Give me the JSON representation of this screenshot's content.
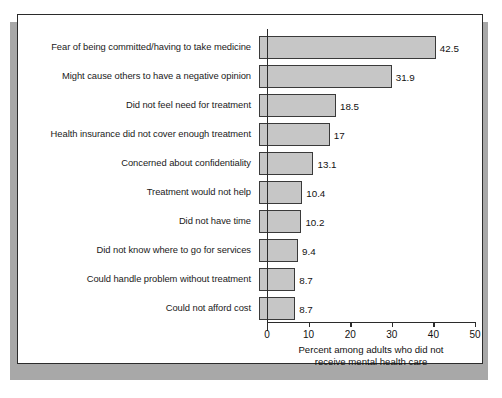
{
  "figure": {
    "frame_color": "#2b2b2b",
    "background": "#ffffff",
    "shadow_color": "#a8a8a8"
  },
  "chart_data": {
    "type": "bar",
    "orientation": "horizontal",
    "title": "",
    "subtitle": "",
    "xlabel_line1": "Percent among adults who did not",
    "xlabel_line2": "receive mental health care",
    "ylabel": "",
    "xlim": [
      0,
      50
    ],
    "xticks": [
      0,
      10,
      20,
      30,
      40,
      50
    ],
    "xtick_labels": [
      "0",
      "10",
      "20",
      "30",
      "40",
      "50"
    ],
    "grid": false,
    "legend": null,
    "bar_color": "#c6c6c6",
    "bar_edge_color": "#3a3a3a",
    "categories": [
      "Fear of being committed/having to take medicine",
      "Might cause others to have a negative opinion",
      "Did not feel need for treatment",
      "Health insurance did not cover enough treatment",
      "Concerned about confidentiality",
      "Treatment would not help",
      "Did not have time",
      "Did not know where to go for services",
      "Could handle problem without treatment",
      "Could not afford cost"
    ],
    "values": [
      42.5,
      31.9,
      18.5,
      17,
      13.1,
      10.4,
      10.2,
      9.4,
      8.7,
      8.7
    ],
    "value_labels": [
      "42.5",
      "31.9",
      "18.5",
      "17",
      "13.1",
      "10.4",
      "10.2",
      "9.4",
      "8.7",
      "8.7"
    ]
  }
}
